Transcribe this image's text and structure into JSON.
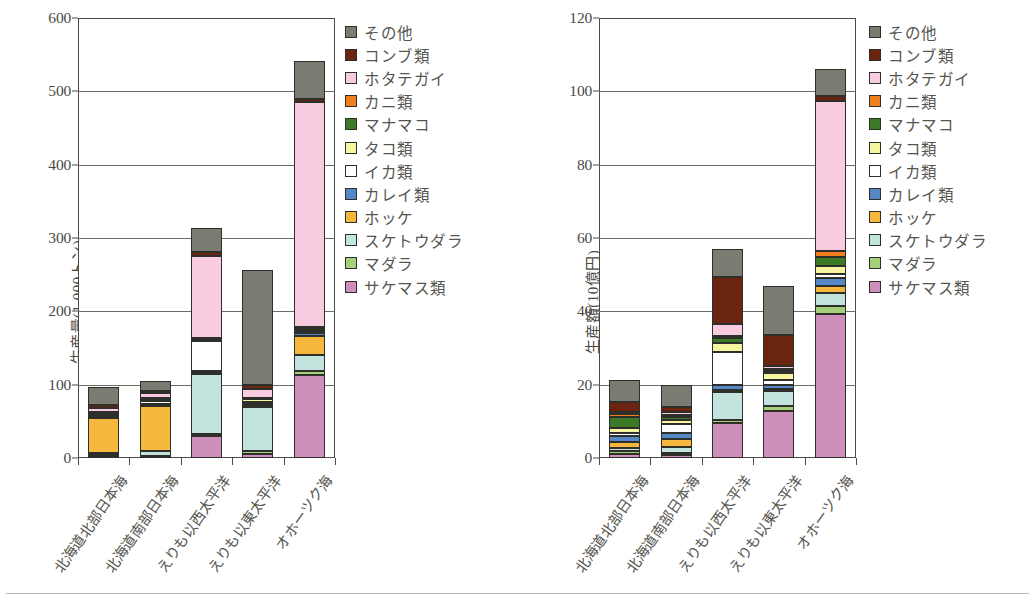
{
  "series_colors": {
    "その他": "#7b7b72",
    "コンブ類": "#6b2410",
    "ホタテガイ": "#f8cbe0",
    "カニ類": "#f07f1c",
    "マナマコ": "#3d7a28",
    "タコ類": "#f7f5a0",
    "イカ類": "#ffffff",
    "カレイ類": "#5588c4",
    "ホッケ": "#f6b83c",
    "スケトウダラ": "#c3e4de",
    "マダラ": "#a6cf7a",
    "サケマス類": "#cf8fbc"
  },
  "legend": {
    "items": [
      {
        "label": "その他",
        "color": "#7b7b72"
      },
      {
        "label": "コンブ類",
        "color": "#6b2410"
      },
      {
        "label": "ホタテガイ",
        "color": "#f8cbe0"
      },
      {
        "label": "カニ類",
        "color": "#f07f1c"
      },
      {
        "label": "マナマコ",
        "color": "#3d7a28"
      },
      {
        "label": "タコ類",
        "color": "#f7f5a0"
      },
      {
        "label": "イカ類",
        "color": "#ffffff"
      },
      {
        "label": "カレイ類",
        "color": "#5588c4"
      },
      {
        "label": "ホッケ",
        "color": "#f6b83c"
      },
      {
        "label": "スケトウダラ",
        "color": "#c3e4de"
      },
      {
        "label": "マダラ",
        "color": "#a6cf7a"
      },
      {
        "label": "サケマス類",
        "color": "#cf8fbc"
      }
    ]
  },
  "chart_data": [
    {
      "type": "bar",
      "id": "production-volume",
      "stacked": true,
      "title": "",
      "xlabel": "",
      "ylabel": "生産量(1,000トン)",
      "ylim": [
        0,
        600
      ],
      "yticks": [
        0,
        100,
        200,
        300,
        400,
        500,
        600
      ],
      "grid": true,
      "legend_position": "right",
      "categories": [
        "北海道北部日本海",
        "北海道南部日本海",
        "えりも以西太平洋",
        "えりも以東太平洋",
        "オホーツク海"
      ],
      "stack_order_bottom_to_top": [
        "サケマス類",
        "マダラ",
        "スケトウダラ",
        "ホッケ",
        "カレイ類",
        "イカ類",
        "タコ類",
        "マナマコ",
        "カニ類",
        "ホタテガイ",
        "コンブ類",
        "その他"
      ],
      "series": [
        {
          "name": "サケマス類",
          "values": [
            2,
            2,
            30,
            5,
            113
          ]
        },
        {
          "name": "マダラ",
          "values": [
            2,
            1,
            3,
            5,
            5
          ]
        },
        {
          "name": "スケトウダラ",
          "values": [
            3,
            6,
            82,
            60,
            22
          ]
        },
        {
          "name": "ホッケ",
          "values": [
            48,
            62,
            2,
            1,
            26
          ]
        },
        {
          "name": "カレイ類",
          "values": [
            2,
            2,
            2,
            3,
            5
          ]
        },
        {
          "name": "イカ類",
          "values": [
            2,
            5,
            40,
            3,
            2
          ]
        },
        {
          "name": "タコ類",
          "values": [
            2,
            2,
            2,
            3,
            3
          ]
        },
        {
          "name": "マナマコ",
          "values": [
            1,
            1,
            1,
            1,
            1
          ]
        },
        {
          "name": "カニ類",
          "values": [
            1,
            1,
            1,
            1,
            2
          ]
        },
        {
          "name": "ホタテガイ",
          "values": [
            5,
            6,
            112,
            12,
            306
          ]
        },
        {
          "name": "コンブ類",
          "values": [
            4,
            3,
            6,
            6,
            4
          ]
        },
        {
          "name": "その他",
          "values": [
            25,
            14,
            33,
            156,
            52
          ]
        }
      ],
      "totals": [
        97,
        105,
        314,
        255,
        561
      ]
    },
    {
      "type": "bar",
      "id": "production-value",
      "stacked": true,
      "title": "",
      "xlabel": "",
      "ylabel": "生産額(10億円)",
      "ylim": [
        0,
        120
      ],
      "yticks": [
        0,
        20,
        40,
        60,
        80,
        100,
        120
      ],
      "grid": true,
      "legend_position": "right",
      "categories": [
        "北海道北部日本海",
        "北海道南部日本海",
        "えりも以西太平洋",
        "えりも以東太平洋",
        "オホーツク海"
      ],
      "stack_order_bottom_to_top": [
        "サケマス類",
        "マダラ",
        "スケトウダラ",
        "ホッケ",
        "カレイ類",
        "イカ類",
        "タコ類",
        "マナマコ",
        "カニ類",
        "ホタテガイ",
        "コンブ類",
        "その他"
      ],
      "series": [
        {
          "name": "サケマス類",
          "values": [
            1.0,
            0.8,
            9.5,
            12.8,
            39.2
          ]
        },
        {
          "name": "マダラ",
          "values": [
            0.8,
            0.5,
            0.8,
            1.5,
            2.3
          ]
        },
        {
          "name": "スケトウダラ",
          "values": [
            1.0,
            1.6,
            7.8,
            4.0,
            3.5
          ]
        },
        {
          "name": "ホッケ",
          "values": [
            1.6,
            2.2,
            0.4,
            0.4,
            2.0
          ]
        },
        {
          "name": "カレイ類",
          "values": [
            1.6,
            1.6,
            1.5,
            1.3,
            2.1
          ]
        },
        {
          "name": "イカ類",
          "values": [
            0.9,
            2.6,
            9.0,
            1.2,
            1.2
          ]
        },
        {
          "name": "タコ類",
          "values": [
            1.2,
            1.2,
            2.4,
            2.0,
            2.2
          ]
        },
        {
          "name": "マナマコ",
          "values": [
            3.2,
            0.8,
            1.2,
            0.5,
            2.2
          ]
        },
        {
          "name": "カニ類",
          "values": [
            0.6,
            0.5,
            0.8,
            0.5,
            1.8
          ]
        },
        {
          "name": "ホタテガイ",
          "values": [
            0.6,
            0.8,
            3.2,
            1.0,
            41.0
          ]
        },
        {
          "name": "コンブ類",
          "values": [
            2.8,
            1.2,
            12.9,
            8.4,
            1.2
          ]
        },
        {
          "name": "その他",
          "values": [
            6.0,
            6.0,
            7.6,
            13.3,
            7.5
          ]
        }
      ],
      "totals": [
        21.3,
        19.8,
        73.2,
        47.0,
        106.5
      ]
    }
  ]
}
